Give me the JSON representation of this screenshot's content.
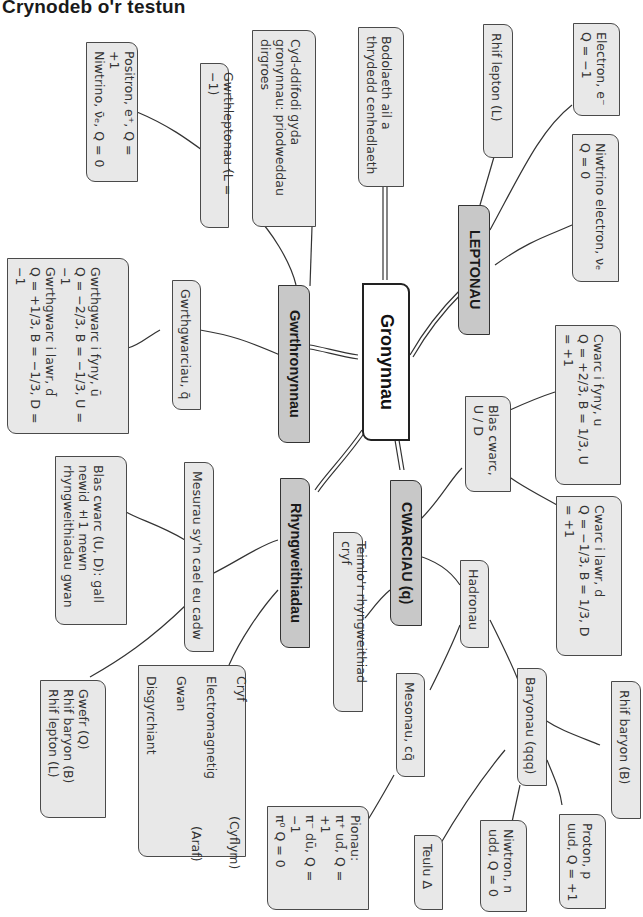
{
  "title": "Crynodeb o'r testun",
  "center": "Gronynnau",
  "branches": {
    "leptonau": {
      "label": "LEPTONAU",
      "children": {
        "rhif_lepton": "Rhif lepton (L)",
        "electron": "Electron, e⁻\nQ = −1",
        "niwtrino_electron": "Niwtrino electron, νₑ\nQ = 0"
      }
    },
    "gwrthronynnau": {
      "label": "Gwrthronynnau",
      "children": {
        "gwrthleptonau": "Gwrthleptonau (L = −1)",
        "positron": "Positron, e⁺, Q = +1\nNiwtrino, ν̄ₑ, Q = 0",
        "cyd_ddifodi": "Cyd-ddifodi gyda\ngronynnau: priodweddau\ndirgroes",
        "gwrthgwarciau": "Gwrthgwarciau, q̄",
        "gwrthgwarc_detail": "Gwrthgwarc i fyny, ū\nQ = −2/3, B = −1/3, U = −1\nGwrthgwarc i lawr, d̄\nQ = +1/3, B = −1/3, D = −1"
      }
    },
    "bodolaeth": "Bodolaeth ail a\nthrydedd cenhedlaeth",
    "cwarciau": {
      "label": "CWARCIAU (q)",
      "children": {
        "blas_cwarc": "Blas cwarc,\nU / D",
        "cwarc_fyny": "Cwarc i fyny, u\nQ = +2/3, B = 1/3, U = +1",
        "cwarc_lawr": "Cwarc i lawr, d\nQ = −1/3, B = 1/3, D = +1",
        "hadronau": "Hadronau",
        "baryonau": "Baryonau (qqq)",
        "rhif_baryon": "Rhif baryon (B)",
        "proton": "Proton, p\nuud, Q = +1",
        "niwtron": "Niwtron, n\nudd, Q = 0",
        "teulu_delta": "Teulu Δ",
        "mesonau": "Mesonau, cq̄",
        "pionau": "Pionau:\nπ⁺ ud̄, Q = +1\nπ⁻ dū, Q = −1\nπ⁰ Q = 0",
        "teimlo": "Teimlo'r rhyngweithiad cryf"
      }
    },
    "rhyngweithiadau": {
      "label": "Rhyngweithiadau",
      "children": {
        "mesurau": "Mesurau sy'n cael eu cadw",
        "blas_newid": "Blas cwarc (U, D): gall\nnewid ±1 mewn\nrhyngweithiadau gwan",
        "cadw_list": "Gwefr (Q)\nRhif baryon (B)\nRhif lepton (L)",
        "forces": [
          "Cryf",
          "Electromagnetig",
          "Gwan",
          "Disgyrchiant"
        ],
        "fast_label": "(Cyflym)",
        "slow_label": "(Araf)"
      }
    }
  },
  "colors": {
    "main_fill": "#c8c8c8",
    "sub_fill": "#e8e8e8",
    "center_fill": "#ffffff",
    "border": "#333333"
  }
}
